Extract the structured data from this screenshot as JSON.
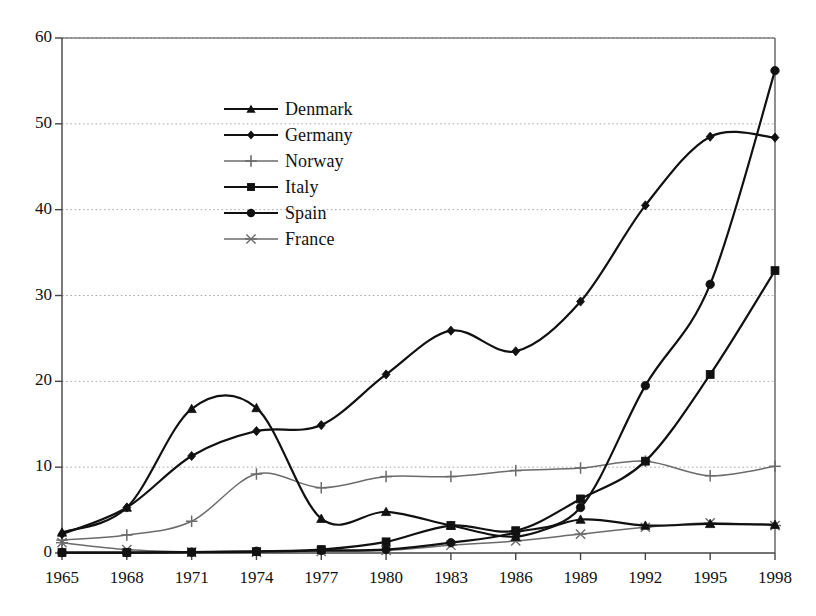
{
  "chart_data": {
    "type": "line",
    "title": "",
    "xlabel": "",
    "ylabel": "",
    "x": [
      1965,
      1968,
      1971,
      1974,
      1977,
      1980,
      1983,
      1986,
      1989,
      1992,
      1995,
      1998
    ],
    "xtick_labels": [
      "1965",
      "1968",
      "1971",
      "1974",
      "1977",
      "1980",
      "1983",
      "1986",
      "1989",
      "1992",
      "1995",
      "1998"
    ],
    "ytick_labels": [
      "0",
      "10",
      "20",
      "30",
      "40",
      "50",
      "60"
    ],
    "yticks": [
      0,
      10,
      20,
      30,
      40,
      50,
      60
    ],
    "ylim": [
      0,
      60
    ],
    "xlim": [
      1965,
      1998
    ],
    "grid": "horizontal-dotted",
    "legend_position": "upper-left-inside",
    "series": [
      {
        "name": "Denmark",
        "marker": "triangle",
        "values": [
          2.4,
          5.3,
          16.8,
          16.9,
          4.0,
          4.8,
          3.2,
          1.9,
          3.9,
          3.2,
          3.4,
          3.3
        ]
      },
      {
        "name": "Germany",
        "marker": "diamond",
        "values": [
          2.2,
          5.3,
          11.3,
          14.2,
          14.9,
          20.8,
          25.9,
          23.5,
          29.3,
          40.5,
          48.5,
          48.4
        ]
      },
      {
        "name": "Norway",
        "marker": "plus",
        "values": [
          1.5,
          2.1,
          3.7,
          9.2,
          7.6,
          8.9,
          8.9,
          9.6,
          9.9,
          10.7,
          9.0,
          10.1
        ]
      },
      {
        "name": "Italy",
        "marker": "square",
        "values": [
          0.05,
          0.05,
          0.1,
          0.15,
          0.4,
          1.3,
          3.2,
          2.6,
          6.3,
          10.7,
          20.8,
          32.9
        ]
      },
      {
        "name": "Spain",
        "marker": "circle",
        "values": [
          0.05,
          0.05,
          0.1,
          0.2,
          0.3,
          0.4,
          1.2,
          2.4,
          5.3,
          19.5,
          31.3,
          56.2
        ]
      },
      {
        "name": "France",
        "marker": "star",
        "values": [
          1.2,
          0.4,
          0.1,
          0.1,
          0.2,
          0.3,
          0.9,
          1.4,
          2.2,
          3.0,
          3.5,
          3.2
        ]
      }
    ]
  },
  "legend": {
    "items": [
      {
        "label": "Denmark",
        "marker": "triangle"
      },
      {
        "label": "Germany",
        "marker": "diamond"
      },
      {
        "label": "Norway",
        "marker": "plus"
      },
      {
        "label": "Italy",
        "marker": "square"
      },
      {
        "label": "Spain",
        "marker": "circle"
      },
      {
        "label": "France",
        "marker": "star"
      }
    ]
  },
  "colors": {
    "line_dark": "#111111",
    "line_light": "#6b6b6b",
    "axis": "#444444",
    "grid": "#aaaaaa",
    "background": "#ffffff"
  }
}
